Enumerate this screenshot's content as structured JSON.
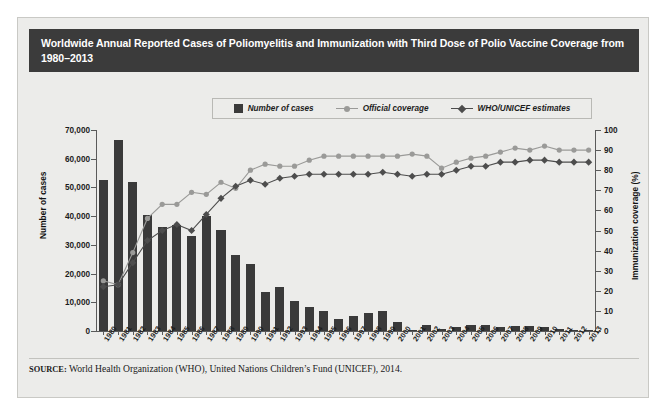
{
  "figure": {
    "title": "Worldwide Annual Reported Cases of Poliomyelitis and Immunization with Third Dose of Polio Vaccine Coverage from 1980–2013",
    "source_prefix": "SOURCE:",
    "source_text": " World Health Organization (WHO), United Nations Children’s Fund (UNICEF), 2014.",
    "colors": {
      "title_bar": "#3b3b3b",
      "panel": "#ececea",
      "bars": "#3a3a3a",
      "official_coverage": "#9a9a98",
      "who_unicef": "#4d4d4d",
      "axis": "#5a5a5a"
    }
  },
  "legend": {
    "position": "top-center",
    "items": [
      {
        "label": "Number of cases",
        "marker": "square-swatch",
        "color": "#3a3a3a"
      },
      {
        "label": "Official coverage",
        "marker": "circle-line",
        "color": "#9a9a98"
      },
      {
        "label": "WHO/UNICEF estimates",
        "marker": "diamond-line",
        "color": "#4d4d4d"
      }
    ]
  },
  "chart_data": {
    "type": "bar",
    "title": "Worldwide Annual Reported Cases of Poliomyelitis and Immunization with Third Dose of Polio Vaccine Coverage from 1980–2013",
    "xlabel": "",
    "ylabel": "Number of cases",
    "y2label": "Immunization coverage (%)",
    "ylim": [
      0,
      70000
    ],
    "y2lim": [
      0,
      100
    ],
    "yticks": [
      0,
      10000,
      20000,
      30000,
      40000,
      50000,
      60000,
      70000
    ],
    "ytick_labels": [
      "0",
      "10,000",
      "20,000",
      "30,000",
      "40,000",
      "50,000",
      "60,000",
      "70,000"
    ],
    "y2ticks": [
      0,
      10,
      20,
      30,
      40,
      50,
      60,
      70,
      80,
      90,
      100
    ],
    "y2tick_labels": [
      "0",
      "10",
      "20",
      "30",
      "40",
      "50",
      "60",
      "70",
      "80",
      "90",
      "100"
    ],
    "grid": false,
    "legend_position": "top-center",
    "categories": [
      "1980",
      "1981",
      "1982",
      "1983",
      "1984",
      "1985",
      "1986",
      "1987",
      "1988",
      "1989",
      "1990",
      "1991",
      "1992",
      "1993",
      "1994",
      "1995",
      "1996",
      "1997",
      "1998",
      "1999",
      "2000",
      "2001",
      "2002",
      "2003",
      "2004",
      "2005",
      "2006",
      "2007",
      "2008",
      "2009",
      "2010",
      "2011",
      "2012",
      "2013"
    ],
    "series": [
      {
        "name": "Number of cases",
        "type": "bar",
        "axis": "left",
        "color": "#3a3a3a",
        "values": [
          52552,
          66486,
          51932,
          40539,
          36084,
          37000,
          33247,
          40113,
          35251,
          26551,
          23484,
          13572,
          15490,
          10487,
          8505,
          7035,
          4074,
          5185,
          6349,
          7141,
          2979,
          483,
          1922,
          784,
          1258,
          1979,
          2233,
          1315,
          1652,
          1606,
          1352,
          650,
          223,
          406
        ]
      },
      {
        "name": "Official coverage",
        "type": "line",
        "axis": "right",
        "color": "#9a9a98",
        "marker": "circle",
        "values": [
          25,
          23,
          39,
          56,
          63,
          63,
          69,
          68,
          74,
          71,
          80,
          83,
          82,
          82,
          85,
          87,
          87,
          87,
          87,
          87,
          87,
          88,
          87,
          81,
          84,
          86,
          87,
          89,
          91,
          90,
          92,
          90,
          90,
          90
        ]
      },
      {
        "name": "WHO/UNICEF estimates",
        "type": "line",
        "axis": "right",
        "color": "#4d4d4d",
        "marker": "diamond",
        "values": [
          22,
          23,
          34,
          45,
          50,
          53,
          50,
          58,
          66,
          72,
          75,
          73,
          76,
          77,
          78,
          78,
          78,
          78,
          78,
          79,
          78,
          77,
          78,
          78,
          80,
          82,
          82,
          84,
          84,
          85,
          85,
          84,
          84,
          84
        ]
      }
    ]
  }
}
